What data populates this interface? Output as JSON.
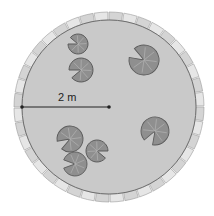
{
  "diagram": {
    "radius_label": "2 m",
    "center": [
      109,
      107
    ],
    "outer_radius": 95,
    "inner_radius": 87,
    "tile_count": 40,
    "colors": {
      "water": "#c9c9c9",
      "tile_light": "#e6e6e6",
      "tile_dark": "#9a9a9a",
      "pad_fill": "#8f8f8f",
      "pad_edge": "#5a5a5a",
      "line": "#222222"
    },
    "lily_pads": [
      {
        "cx": 78,
        "cy": 44,
        "r": 10,
        "rot": 200
      },
      {
        "cx": 81,
        "cy": 70,
        "r": 12,
        "rot": 160
      },
      {
        "cx": 144,
        "cy": 60,
        "r": 15,
        "rot": 210
      },
      {
        "cx": 155,
        "cy": 131,
        "r": 14,
        "rot": 120
      },
      {
        "cx": 70,
        "cy": 139,
        "r": 13,
        "rot": 150
      },
      {
        "cx": 97,
        "cy": 151,
        "r": 11,
        "rot": 20
      },
      {
        "cx": 75,
        "cy": 164,
        "r": 12,
        "rot": 180
      }
    ]
  }
}
